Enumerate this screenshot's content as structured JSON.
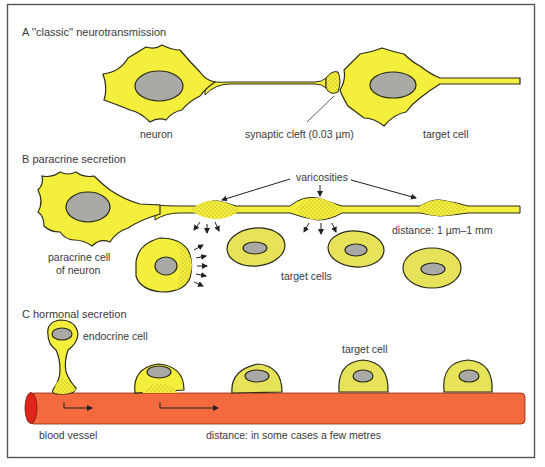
{
  "figure": {
    "frame_color": "#555555",
    "colors": {
      "cell_yellow": "#f4ee3c",
      "target_cell_yellow": "#e6e35a",
      "nucleus_gray": "#a9a9a6",
      "vessel_orange": "#f26a3e",
      "vessel_end_red": "#e0241c",
      "outline": "#2a2a1a"
    },
    "panels": [
      {
        "id": "A",
        "title": "A  ''classic'' neurotransmission",
        "labels": {
          "neuron": "neuron",
          "synaptic_cleft": "synaptic cleft (0.03 µm)",
          "target_cell": "target cell"
        }
      },
      {
        "id": "B",
        "title": "B  paracrine secretion",
        "labels": {
          "varicosities": "varicosities",
          "paracrine_cell_line1": "paracrine cell",
          "paracrine_cell_line2": "of neuron",
          "target_cells": "target cells",
          "distance": "distance: 1 µm–1 mm"
        }
      },
      {
        "id": "C",
        "title": "C  hormonal secretion",
        "labels": {
          "endocrine_cell": "endocrine cell",
          "target_cell": "target cell",
          "blood_vessel": "blood vessel",
          "distance": "distance: in some cases a few metres"
        }
      }
    ]
  }
}
